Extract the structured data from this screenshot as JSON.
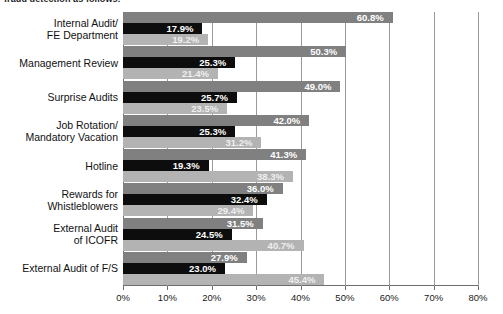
{
  "caption": {
    "clipped_text": "fraud detection as follows:"
  },
  "chart_data": {
    "type": "bar",
    "orientation": "horizontal",
    "title": "",
    "subtitle": "",
    "xlabel": "",
    "ylabel": "",
    "xlim": [
      0,
      80
    ],
    "xtick_labels": [
      "0%",
      "10%",
      "20%",
      "30%",
      "40%",
      "50%",
      "60%",
      "70%",
      "80%"
    ],
    "xticks": [
      0,
      10,
      20,
      30,
      40,
      50,
      60,
      70,
      80
    ],
    "grid": true,
    "legend": false,
    "legend_position": "none",
    "value_suffix": "%",
    "categories": [
      "Internal Audit/\nFE Department",
      "Management Review",
      "Surprise Audits",
      "Job Rotation/\nMandatory Vacation",
      "Hotline",
      "Rewards for\nWhistleblowers",
      "External Audit\nof ICOFR",
      "External Audit of F/S"
    ],
    "category_lines": [
      [
        "Internal Audit/",
        "FE Department"
      ],
      [
        "Management Review"
      ],
      [
        "Surprise Audits"
      ],
      [
        "Job Rotation/",
        "Mandatory Vacation"
      ],
      [
        "Hotline"
      ],
      [
        "Rewards for",
        "Whistleblowers"
      ],
      [
        "External Audit",
        "of ICOFR"
      ],
      [
        "External Audit of F/S"
      ]
    ],
    "series": [
      {
        "name": "Series 1",
        "color": "#808080",
        "values": [
          60.8,
          50.3,
          49.0,
          42.0,
          41.3,
          36.0,
          31.5,
          27.9
        ],
        "labels": [
          "60.8%",
          "50.3%",
          "49.0%",
          "42.0%",
          "41.3%",
          "36.0%",
          "31.5%",
          "27.9%"
        ]
      },
      {
        "name": "Series 2",
        "color": "#0d0d0d",
        "values": [
          17.9,
          25.3,
          25.7,
          25.3,
          19.3,
          32.4,
          24.5,
          23.0
        ],
        "labels": [
          "17.9%",
          "25.3%",
          "25.7%",
          "25.3%",
          "19.3%",
          "32.4%",
          "24.5%",
          "23.0%"
        ]
      },
      {
        "name": "Series 3",
        "color": "#b3b3b3",
        "values": [
          19.2,
          21.4,
          23.5,
          31.2,
          38.3,
          29.4,
          40.7,
          45.4
        ],
        "labels": [
          "19.2%",
          "21.4%",
          "23.5%",
          "31.2%",
          "38.3%",
          "29.4%",
          "40.7%",
          "45.4%"
        ]
      }
    ]
  }
}
